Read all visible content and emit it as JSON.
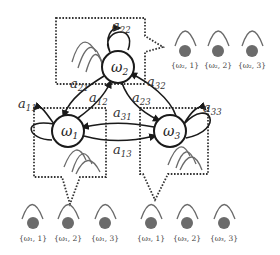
{
  "diagram": {
    "type": "hidden-markov-model",
    "states": [
      {
        "id": "w1",
        "symbol": "ω",
        "sub": "1",
        "cx": 68,
        "cy": 131
      },
      {
        "id": "w2",
        "symbol": "ω",
        "sub": "2",
        "cx": 118,
        "cy": 67
      },
      {
        "id": "w3",
        "symbol": "ω",
        "sub": "3",
        "cx": 170,
        "cy": 131
      }
    ],
    "transitions": [
      {
        "label": "a",
        "sub": "11",
        "from": "w1",
        "to": "w1"
      },
      {
        "label": "a",
        "sub": "22",
        "from": "w2",
        "to": "w2"
      },
      {
        "label": "a",
        "sub": "33",
        "from": "w3",
        "to": "w3"
      },
      {
        "label": "a",
        "sub": "12",
        "from": "w1",
        "to": "w2"
      },
      {
        "label": "a",
        "sub": "21",
        "from": "w2",
        "to": "w1"
      },
      {
        "label": "a",
        "sub": "23",
        "from": "w2",
        "to": "w3"
      },
      {
        "label": "a",
        "sub": "32",
        "from": "w3",
        "to": "w2"
      },
      {
        "label": "a",
        "sub": "13",
        "from": "w1",
        "to": "w3"
      },
      {
        "label": "a",
        "sub": "31",
        "from": "w3",
        "to": "w1"
      }
    ],
    "emissions": {
      "w2": [
        "{ω2, 1}",
        "{ω2, 2}",
        "{ω2, 3}"
      ],
      "w1": [
        "{ω1, 1}",
        "{ω1, 2}",
        "{ω1, 3}"
      ],
      "w3": [
        "{ω3, 1}",
        "{ω3, 2}",
        "{ω3, 3}"
      ]
    }
  },
  "labels": {
    "w1": {
      "sym": "ω",
      "sub": "1"
    },
    "w2": {
      "sym": "ω",
      "sub": "2"
    },
    "w3": {
      "sym": "ω",
      "sub": "3"
    },
    "a11": {
      "sym": "a",
      "sub": "11"
    },
    "a22": {
      "sym": "a",
      "sub": "22"
    },
    "a33": {
      "sym": "a",
      "sub": "33"
    },
    "a12": {
      "sym": "a",
      "sub": "12"
    },
    "a21": {
      "sym": "a",
      "sub": "21"
    },
    "a23": {
      "sym": "a",
      "sub": "23"
    },
    "a32": {
      "sym": "a",
      "sub": "32"
    },
    "a13": {
      "sym": "a",
      "sub": "13"
    },
    "a31": {
      "sym": "a",
      "sub": "31"
    },
    "e21": "{ω₂, 1}",
    "e22": "{ω₂, 2}",
    "e23": "{ω₂, 3}",
    "e11": "{ω₁, 1}",
    "e12": "{ω₁, 2}",
    "e13": "{ω₁, 3}",
    "e31": "{ω₃, 1}",
    "e32": "{ω₃, 2}",
    "e33": "{ω₃, 3}"
  }
}
